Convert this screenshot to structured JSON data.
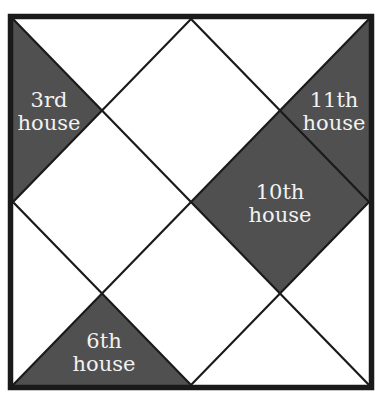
{
  "diagram": {
    "type": "north-indian-horoscope-chart",
    "colors": {
      "background": "#ffffff",
      "line": "#1a1a1a",
      "shaded": "#505050",
      "label_text": "#f2f2f2"
    },
    "houses": [
      {
        "id": "3rd",
        "line1": "3rd",
        "line2": "house",
        "shaded": true
      },
      {
        "id": "11th",
        "line1": "11th",
        "line2": "house",
        "shaded": true
      },
      {
        "id": "10th",
        "line1": "10th",
        "line2": "house",
        "shaded": true
      },
      {
        "id": "6th",
        "line1": "6th",
        "line2": "house",
        "shaded": true
      }
    ]
  }
}
